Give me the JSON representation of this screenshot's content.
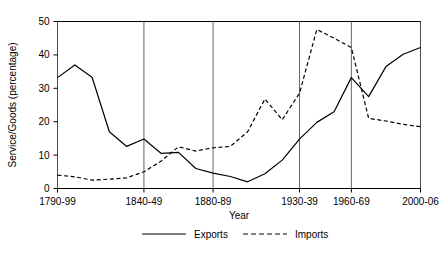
{
  "chart_data": {
    "type": "line",
    "title": "",
    "xlabel": "Year",
    "ylabel": "Service/Goods (percentage)",
    "ylim": [
      0,
      50
    ],
    "yticks": [
      0,
      10,
      20,
      30,
      40,
      50
    ],
    "ytick_labels": [
      "0",
      "10",
      "20",
      "30",
      "40",
      "50"
    ],
    "grid": "vertical-only",
    "legend_position": "bottom-center",
    "x_axis_kind": "decades",
    "xtick_labels": [
      "1790-99",
      "1840-49",
      "1880-89",
      "1930-39",
      "1960-69",
      "2000-06"
    ],
    "xtick_decades": [
      "1790-99",
      "1840-49",
      "1880-89",
      "1930-39",
      "1960-69",
      "2000-06"
    ],
    "categories": [
      "1790-99",
      "1800-09",
      "1810-19",
      "1820-29",
      "1830-39",
      "1840-49",
      "1850-59",
      "1860-69",
      "1870-79",
      "1880-89",
      "1890-99",
      "1900-09",
      "1910-19",
      "1920-29",
      "1930-39",
      "1940-49",
      "1950-59",
      "1960-69",
      "1970-79",
      "1980-89",
      "1990-99",
      "2000-06"
    ],
    "series": [
      {
        "name": "Exports",
        "style": "solid",
        "color": "#000000",
        "values": [
          33.2,
          37.0,
          33.3,
          17.0,
          12.6,
          14.8,
          10.5,
          10.8,
          6.0,
          4.6,
          3.6,
          2.0,
          4.4,
          8.5,
          14.8,
          19.8,
          23.0,
          33.2,
          27.5,
          36.5,
          40.2,
          42.2
        ]
      },
      {
        "name": "Imports",
        "style": "dashed",
        "color": "#000000",
        "values": [
          4.0,
          3.5,
          2.5,
          2.8,
          3.2,
          5.0,
          8.2,
          12.5,
          11.2,
          12.2,
          12.6,
          17.0,
          26.8,
          20.6,
          28.5,
          47.6,
          45.0,
          42.2,
          21.0,
          20.2,
          19.2,
          18.5
        ]
      }
    ],
    "legend": [
      {
        "label": "Exports",
        "style": "solid"
      },
      {
        "label": "Imports",
        "style": "dashed"
      }
    ]
  }
}
